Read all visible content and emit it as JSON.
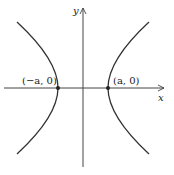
{
  "diagram": {
    "type": "hyperbola",
    "axes": {
      "x_label": "x",
      "y_label": "y"
    },
    "vertices": [
      {
        "label": "(−a, 0)",
        "x": -1,
        "y": 0
      },
      {
        "label": "(a, 0)",
        "x": 1,
        "y": 0
      }
    ],
    "colors": {
      "curve": "#333333",
      "axis": "#444444"
    }
  }
}
